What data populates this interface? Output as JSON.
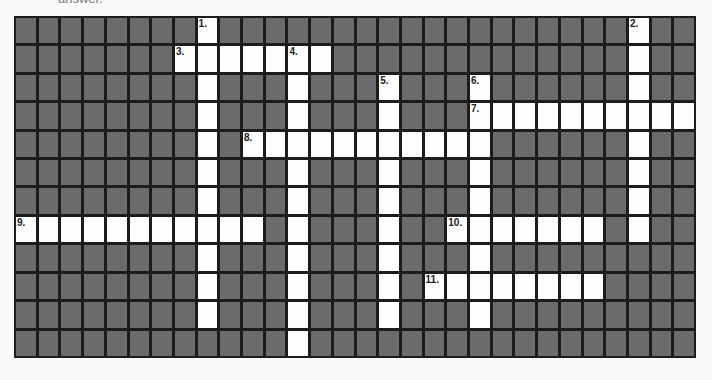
{
  "instructions": "answer.",
  "grid": {
    "cols": 30,
    "rows": 12,
    "colors": {
      "block": "#6b6b6b",
      "open": "#fdfdfd",
      "border": "#1c1c1c"
    }
  },
  "clues": [
    {
      "number": "1.",
      "direction": "down",
      "row": 0,
      "col": 8,
      "length": 11
    },
    {
      "number": "2.",
      "direction": "down",
      "row": 0,
      "col": 27,
      "length": 8
    },
    {
      "number": "3.",
      "direction": "across",
      "row": 1,
      "col": 7,
      "length": 7
    },
    {
      "number": "4.",
      "direction": "down",
      "row": 1,
      "col": 12,
      "length": 11
    },
    {
      "number": "5.",
      "direction": "down",
      "row": 2,
      "col": 16,
      "length": 9
    },
    {
      "number": "6.",
      "direction": "down",
      "row": 2,
      "col": 20,
      "length": 9
    },
    {
      "number": "7.",
      "direction": "across",
      "row": 3,
      "col": 20,
      "length": 10
    },
    {
      "number": "8.",
      "direction": "across",
      "row": 4,
      "col": 10,
      "length": 11
    },
    {
      "number": "9.",
      "direction": "across",
      "row": 7,
      "col": 0,
      "length": 11
    },
    {
      "number": "10.",
      "direction": "across",
      "row": 7,
      "col": 19,
      "length": 7
    },
    {
      "number": "11.",
      "direction": "across",
      "row": 9,
      "col": 18,
      "length": 8
    }
  ]
}
